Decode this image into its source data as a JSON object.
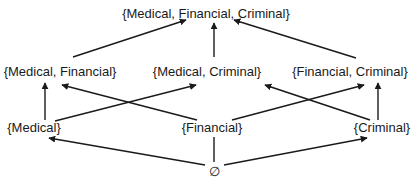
{
  "diagram": {
    "type": "lattice",
    "nodes": {
      "top": {
        "label": "{Medical, Financial, Criminal}"
      },
      "med_fin": {
        "label": "{Medical, Financial}"
      },
      "med_crim": {
        "label": "{Medical, Criminal}"
      },
      "fin_crim": {
        "label": "{Financial, Criminal}"
      },
      "med": {
        "label": "{Medical}"
      },
      "fin": {
        "label": "{Financial}"
      },
      "crim": {
        "label": "{Criminal}"
      },
      "empty": {
        "label": "∅"
      }
    },
    "edges": [
      {
        "from": "med_fin",
        "to": "top",
        "arrow": true
      },
      {
        "from": "med_crim",
        "to": "top",
        "arrow": true
      },
      {
        "from": "fin_crim",
        "to": "top",
        "arrow": true
      },
      {
        "from": "med",
        "to": "med_fin",
        "arrow": true
      },
      {
        "from": "med",
        "to": "med_crim",
        "arrow": true
      },
      {
        "from": "fin",
        "to": "med_fin",
        "arrow": true
      },
      {
        "from": "fin",
        "to": "fin_crim",
        "arrow": true
      },
      {
        "from": "crim",
        "to": "med_crim",
        "arrow": true
      },
      {
        "from": "crim",
        "to": "fin_crim",
        "arrow": true
      },
      {
        "from": "empty",
        "to": "med",
        "arrow": true
      },
      {
        "from": "empty",
        "to": "fin",
        "arrow": false
      },
      {
        "from": "empty",
        "to": "crim",
        "arrow": true
      }
    ],
    "colors": {
      "line": "#1a1a1a",
      "text": "#1a1a1a",
      "background": "#ffffff"
    }
  }
}
